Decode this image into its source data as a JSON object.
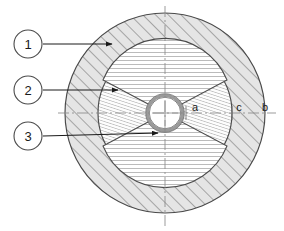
{
  "figure": {
    "background_color": "#ffffff",
    "line_color": "#3c3c3c",
    "outer_fill": "#e8e8e8",
    "hub_fill": "#fdfdfd",
    "bore_ring_color": "#9a9a9a",
    "centerline_color": "#8a8a8a"
  },
  "callouts": [
    {
      "id": "1",
      "label": "1",
      "circle": {
        "cx": 28,
        "cy": 44,
        "r": 14
      },
      "leader": {
        "x1": 42,
        "y1": 44,
        "x2": 112,
        "y2": 44
      },
      "target": "outer-annulus"
    },
    {
      "id": "2",
      "label": "2",
      "circle": {
        "cx": 28,
        "cy": 90,
        "r": 14
      },
      "leader": {
        "x1": 42,
        "y1": 90,
        "x2": 118,
        "y2": 90
      },
      "target": "middle-disc"
    },
    {
      "id": "3",
      "label": "3",
      "circle": {
        "cx": 28,
        "cy": 136,
        "r": 14
      },
      "leader": {
        "x1": 42,
        "y1": 136,
        "x2": 158,
        "y2": 136
      },
      "target": "bore-ring"
    }
  ],
  "dimension_labels": [
    {
      "id": "a",
      "label": "a",
      "x": 195,
      "y": 108
    },
    {
      "id": "c",
      "label": "c",
      "x": 239,
      "y": 108
    },
    {
      "id": "b",
      "label": "b",
      "x": 265,
      "y": 108
    }
  ],
  "geometry": {
    "center": {
      "cx": 165,
      "cy": 113
    },
    "outer_radius": 100,
    "middle_radius": 67,
    "bore_outer_radius": 18,
    "bore_inner_radius": 15,
    "wedge_half_angle_deg": 28,
    "centerline_horizontal": {
      "x1": 58,
      "x2": 276,
      "y": 113
    },
    "centerline_vertical": {
      "y1": 6,
      "y2": 226,
      "x": 165
    }
  }
}
